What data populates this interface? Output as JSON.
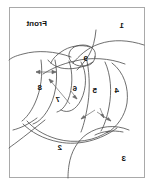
{
  "figure": {
    "title_text": "Front",
    "orientation_note": "mirrored",
    "frame": {
      "border_color": "#a9a9a9",
      "background_color": "#ffffff",
      "x": 8,
      "y": 7,
      "width": 136,
      "height": 171
    },
    "line_color": "#4a4a4a",
    "arrow_color": "#6b6b6b",
    "labels": [
      {
        "id": "label-1",
        "text": "1",
        "x": 29,
        "y": 22
      },
      {
        "id": "label-2",
        "text": "2",
        "x": 91,
        "y": 144
      },
      {
        "id": "label-3",
        "text": "3",
        "x": 27,
        "y": 155
      },
      {
        "id": "label-4",
        "text": "4",
        "x": 34,
        "y": 87
      },
      {
        "id": "label-5",
        "text": "5",
        "x": 56,
        "y": 87
      },
      {
        "id": "label-6",
        "text": "6",
        "x": 76,
        "y": 85
      },
      {
        "id": "label-7",
        "text": "7",
        "x": 93,
        "y": 96
      },
      {
        "id": "label-8",
        "text": "8",
        "x": 111,
        "y": 84
      },
      {
        "id": "label-9",
        "text": "9",
        "x": 65,
        "y": 55
      },
      {
        "id": "label-front",
        "text": "Front",
        "x": 106,
        "y": 20
      }
    ]
  }
}
